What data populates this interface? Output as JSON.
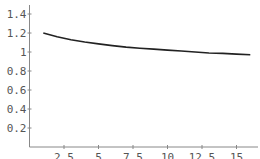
{
  "chart_data": {
    "type": "line",
    "title": "",
    "xlabel": "",
    "ylabel": "",
    "xlim": [
      0,
      17
    ],
    "ylim": [
      0,
      1.5
    ],
    "grid": false,
    "x_ticks": [
      "2.5",
      "5",
      "7.5",
      "10",
      "12.5",
      "15"
    ],
    "y_ticks": [
      "0.2",
      "0.4",
      "0.6",
      "0.8",
      "1",
      "1.2",
      "1.4"
    ],
    "series": [
      {
        "name": "curve",
        "color": "#222222",
        "x": [
          1,
          2,
          3,
          4,
          5,
          6,
          7,
          8,
          9,
          10,
          11,
          12,
          13,
          14,
          15,
          16
        ],
        "y": [
          1.2,
          1.16,
          1.13,
          1.105,
          1.085,
          1.067,
          1.052,
          1.04,
          1.03,
          1.02,
          1.01,
          1.0,
          0.99,
          0.985,
          0.978,
          0.972
        ]
      }
    ]
  }
}
